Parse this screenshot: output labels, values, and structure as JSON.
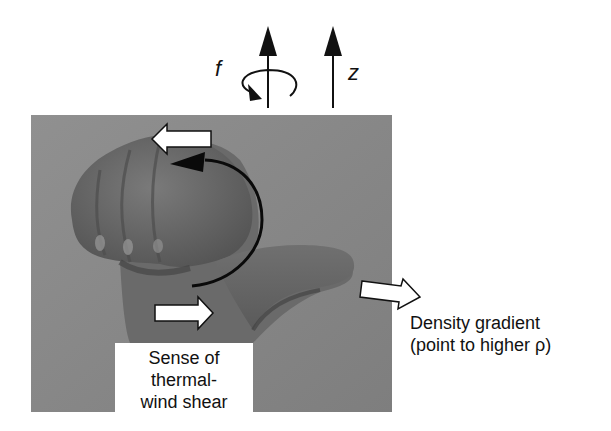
{
  "figure": {
    "type": "right-hand-rule thermal-wind diagram",
    "axes": {
      "rotation_label": "f",
      "vertical_label": "z"
    },
    "labels": {
      "density_gradient_line1": "Density gradient",
      "density_gradient_line2": "(point to higher ρ)",
      "shear_line1": "Sense of",
      "shear_line2": "thermal-",
      "shear_line3": "wind shear"
    },
    "colors": {
      "background": "#ffffff",
      "photo_background": "#8a8a8a",
      "hand": "#6e6e6e",
      "hand_shadow": "#4a4a4a",
      "arrow_fill": "#ffffff",
      "arrow_stroke": "#111111",
      "curve": "#0a0a0a"
    }
  }
}
